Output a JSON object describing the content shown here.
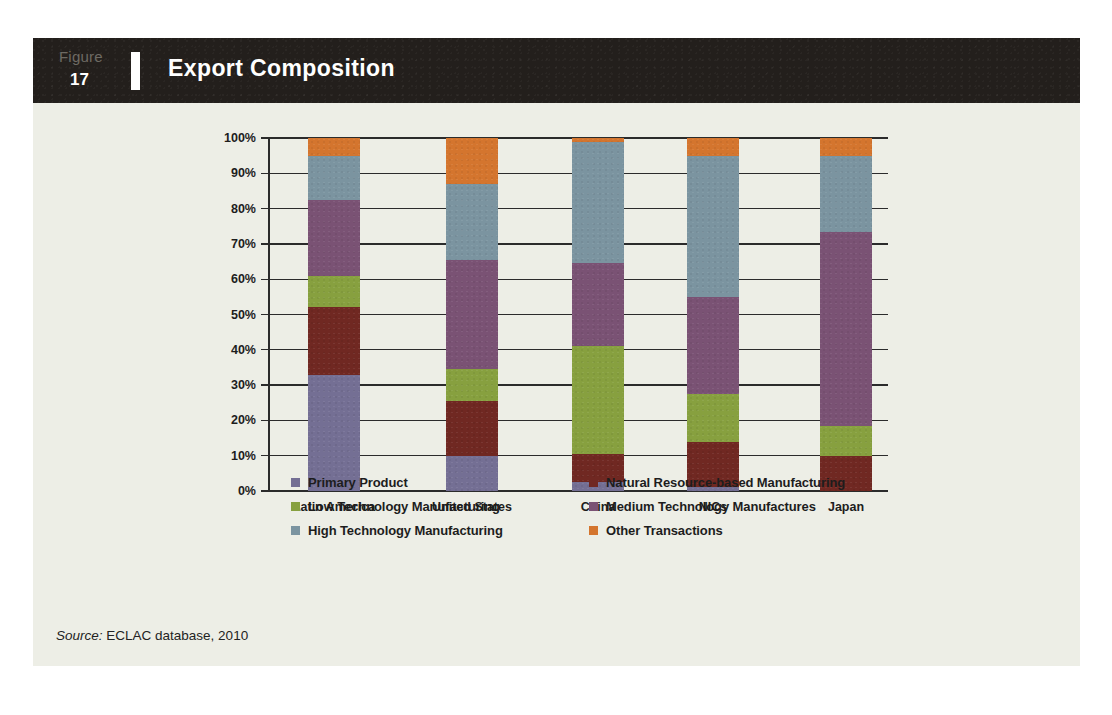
{
  "figure": {
    "label": "Figure",
    "number": "17",
    "title": "Export Composition"
  },
  "source": {
    "prefix": "Source:",
    "text": "ECLAC database, 2010"
  },
  "colors": {
    "page_background": "#ffffff",
    "sheet_background": "#edeee6",
    "header_band": "#231f1c",
    "primary_product": "#746f94",
    "natural_resource_based_manufacturing": "#702822",
    "low_technology_manufacturing": "#87a03f",
    "medium_technology_manufactures": "#7a5274",
    "high_technology_manufacturing": "#7b94a0",
    "other_transactions": "#d4752e",
    "axis": "#2b2b2b",
    "text": "#1d1d1d"
  },
  "chart_data": {
    "type": "bar",
    "stacked": true,
    "normalized_percent": true,
    "title": "Export Composition",
    "xlabel": "",
    "ylabel": "",
    "ylim": [
      0,
      100
    ],
    "yticks": [
      "0%",
      "10%",
      "20%",
      "30%",
      "40%",
      "50%",
      "60%",
      "70%",
      "80%",
      "90%",
      "100%"
    ],
    "ytick_values": [
      0,
      10,
      20,
      30,
      40,
      50,
      60,
      70,
      80,
      90,
      100
    ],
    "grid": true,
    "legend_position": "bottom",
    "categories": [
      "Latin America",
      "United States",
      "China",
      "NICs",
      "Japan"
    ],
    "series": [
      {
        "name": "Primary Product",
        "color": "#746f94",
        "values": [
          33.0,
          10.0,
          2.5,
          1.0,
          0.0
        ]
      },
      {
        "name": "Natural Resource-based Manufacturing",
        "color": "#702822",
        "values": [
          19.0,
          15.5,
          8.0,
          13.0,
          10.0
        ]
      },
      {
        "name": "Low Technology Manufacturing",
        "color": "#87a03f",
        "values": [
          9.0,
          9.0,
          30.5,
          13.5,
          8.5
        ]
      },
      {
        "name": "Medium Technology Manufactures",
        "color": "#7a5274",
        "values": [
          21.5,
          31.0,
          23.5,
          27.5,
          55.0
        ]
      },
      {
        "name": "High Technology Manufacturing",
        "color": "#7b94a0",
        "values": [
          12.5,
          21.5,
          34.5,
          40.0,
          21.5
        ]
      },
      {
        "name": "Other Transactions",
        "color": "#d4752e",
        "values": [
          5.0,
          13.0,
          1.0,
          5.0,
          5.0
        ]
      }
    ]
  },
  "legend": {
    "column_one": [
      {
        "label": "Primary Product",
        "color": "#746f94"
      },
      {
        "label": "Low Technology Manufacturing",
        "color": "#87a03f"
      },
      {
        "label": "High Technology Manufacturing",
        "color": "#7b94a0"
      }
    ],
    "column_two": [
      {
        "label": "Natural Resource-based Manufacturing",
        "color": "#702822"
      },
      {
        "label": "Medium Technology Manufactures",
        "color": "#7a5274"
      },
      {
        "label": "Other Transactions",
        "color": "#d4752e"
      }
    ]
  }
}
